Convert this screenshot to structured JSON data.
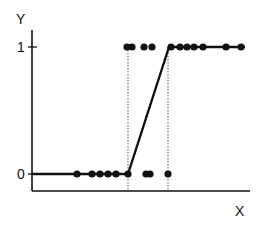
{
  "chart_data": {
    "type": "scatter",
    "title": "",
    "xlabel": "X",
    "ylabel": "Y",
    "yticks": [
      "0",
      "1"
    ],
    "ylim": [
      0,
      1
    ],
    "grid": false,
    "legend": null,
    "series": [
      {
        "name": "observations_y0",
        "y": 0,
        "x": [
          77,
          92,
          100,
          108,
          116,
          128,
          146,
          150,
          168
        ]
      },
      {
        "name": "observations_y1",
        "y": 1,
        "x": [
          127,
          132,
          144,
          152,
          171,
          180,
          187,
          194,
          203,
          226,
          241
        ]
      },
      {
        "name": "linear_probability_fit",
        "type": "line",
        "points": [
          [
            32,
            0
          ],
          [
            128,
            0
          ],
          [
            169,
            1
          ],
          [
            245,
            1
          ]
        ]
      }
    ],
    "annotations": [
      {
        "type": "vertical-dotted-line",
        "x": 128
      },
      {
        "type": "vertical-dotted-line",
        "x": 168
      }
    ]
  },
  "labels": {
    "y_axis": "Y",
    "x_axis": "X",
    "tick_one": "1",
    "tick_zero": "0"
  }
}
